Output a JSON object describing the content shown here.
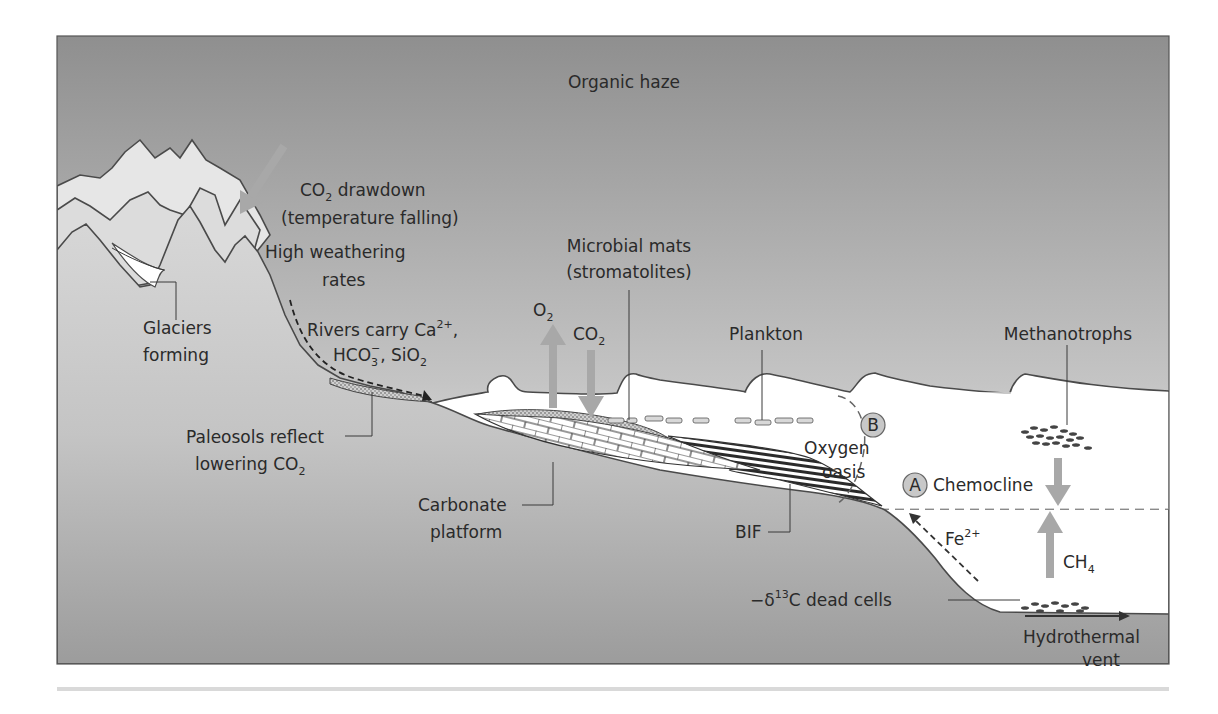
{
  "title": "Organic haze",
  "colors": {
    "sky_top": "#8f8f8f",
    "sky_bottom": "#ffffff",
    "land_top": "#d6d6d6",
    "land_bottom": "#9a9a9a",
    "arrow_gray": "#a8a8a8",
    "line": "#3a3a3a",
    "water_surface": "#ffffff",
    "deep_water": "#f0f0f0"
  },
  "labels": {
    "co2_drawdown_line1_main": "CO",
    "co2_drawdown_line1_sub": "2",
    "co2_drawdown_line1_rest": " drawdown",
    "co2_drawdown_line2": "(temperature falling)",
    "high_weathering_line1": "High weathering",
    "high_weathering_line2": "rates",
    "glaciers_line1": "Glaciers",
    "glaciers_line2": "forming",
    "rivers_line1_main": "Rivers carry Ca",
    "rivers_line1_sup": "2+",
    "rivers_line1_rest": ",",
    "rivers_line2_a": "HCO",
    "rivers_line2_sub": "3",
    "rivers_line2_sup": "−",
    "rivers_line2_b": ", SiO",
    "rivers_line2_sub2": "2",
    "paleosols_line1": "Paleosols reflect",
    "paleosols_line2_main": "lowering CO",
    "paleosols_line2_sub": "2",
    "microbial_line1": "Microbial mats",
    "microbial_line2": "(stromatolites)",
    "o2_main": "O",
    "o2_sub": "2",
    "co2_main": "CO",
    "co2_sub": "2",
    "plankton": "Plankton",
    "methanotrophs": "Methanotrophs",
    "marker_b": "B",
    "oxygen_line1": "Oxygen",
    "oxygen_line2": "oasis",
    "marker_a": "A",
    "chemocline": "Chemocline",
    "carbonate_line1": "Carbonate",
    "carbonate_line2": "platform",
    "bif": "BIF",
    "fe_main": "Fe",
    "fe_sup": "2+",
    "ch4_main": "CH",
    "ch4_sub": "4",
    "dead_cells_prefix": "−δ",
    "dead_cells_sup": "13",
    "dead_cells_rest": "C dead cells",
    "hydrothermal_line1": "Hydrothermal",
    "hydrothermal_line2": "vent"
  },
  "icons": {
    "co2_drawdown_arrow": "arrow-down-left",
    "o2_arrow": "arrow-up",
    "co2_arrow": "arrow-down",
    "methane_down_arrow": "arrow-down",
    "ch4_arrow": "arrow-up",
    "fe_arrow": "dashed-arrow-up-left",
    "rivers_arrow": "dashed-arrow-right",
    "vent_arrow": "arrow-right"
  }
}
